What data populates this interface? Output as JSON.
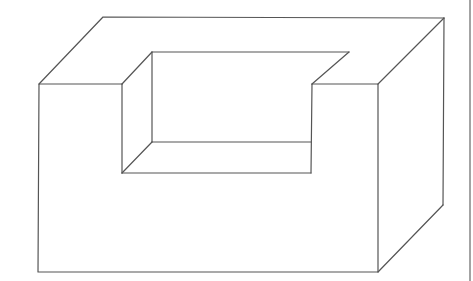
{
  "diagram": {
    "type": "isometric-line-drawing",
    "stroke_color": "#555555",
    "background": "#ffffff",
    "vertices": {
      "back_top_left": [
        103,
        17
      ],
      "back_top_right": [
        444,
        18
      ],
      "back_bottom_right": [
        443,
        205
      ],
      "front_top_left": [
        39,
        84
      ],
      "front_top_right": [
        378,
        84
      ],
      "front_bottom_left": [
        38,
        272
      ],
      "front_bottom_right": [
        378,
        272
      ],
      "notch_front_left_top": [
        122,
        84
      ],
      "notch_front_right_top": [
        312,
        84
      ],
      "notch_back_left_top": [
        152,
        52
      ],
      "notch_back_right_top": [
        349,
        52
      ],
      "notch_front_left_bottom": [
        122,
        173
      ],
      "notch_front_right_bottom": [
        311,
        173
      ],
      "notch_back_left_bottom": [
        152,
        142
      ],
      "notch_back_right_bottom": [
        311,
        142
      ]
    },
    "right_border_x": 470
  }
}
